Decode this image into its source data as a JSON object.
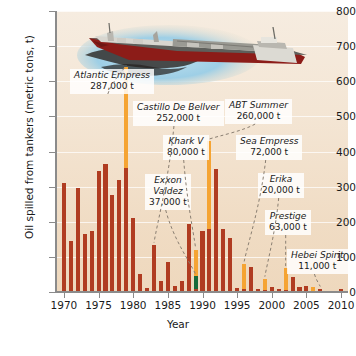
{
  "chart_data": {
    "type": "bar",
    "title": "",
    "xlabel": "Year",
    "ylabel": "Oil spilled from tankers (metric tons, t)",
    "xlim": [
      1969,
      2011
    ],
    "ylim": [
      0,
      800
    ],
    "ytick_labels": [
      "0",
      "100",
      "200",
      "300",
      "400",
      "500",
      "600",
      "700",
      "800"
    ],
    "ytick_values": [
      0,
      100,
      200,
      300,
      400,
      500,
      600,
      700,
      800
    ],
    "xtick_labels": [
      "1970",
      "1975",
      "1980",
      "1985",
      "1990",
      "1995",
      "2000",
      "2005",
      "2010"
    ],
    "xtick_values": [
      1970,
      1975,
      1980,
      1985,
      1990,
      1995,
      2000,
      2005,
      2010
    ],
    "grid": "horizontal",
    "legend": "none",
    "series": [
      {
        "name": "Oil spilled from tankers",
        "color": "#b03c21"
      },
      {
        "name": "Major named spill",
        "color": "#f5a433"
      },
      {
        "name": "Exxon Valdez",
        "color": "#176a3a"
      }
    ],
    "x": [
      1970,
      1971,
      1972,
      1973,
      1974,
      1975,
      1976,
      1977,
      1978,
      1979,
      1980,
      1981,
      1982,
      1983,
      1984,
      1985,
      1986,
      1987,
      1988,
      1989,
      1990,
      1991,
      1992,
      1993,
      1994,
      1995,
      1996,
      1997,
      1998,
      1999,
      2000,
      2001,
      2002,
      2003,
      2004,
      2005,
      2006,
      2007,
      2008,
      2009,
      2010
    ],
    "values": [
      310,
      145,
      295,
      165,
      175,
      345,
      365,
      275,
      320,
      640,
      210,
      50,
      12,
      135,
      30,
      85,
      18,
      30,
      195,
      120,
      175,
      430,
      350,
      180,
      155,
      12,
      80,
      72,
      10,
      38,
      14,
      8,
      67,
      42,
      15,
      18,
      13,
      10,
      4,
      2,
      10
    ],
    "base_values": [
      310,
      145,
      295,
      165,
      175,
      345,
      365,
      275,
      320,
      353,
      210,
      50,
      12,
      135,
      30,
      85,
      18,
      30,
      195,
      8,
      175,
      180,
      350,
      180,
      155,
      12,
      10,
      72,
      10,
      5,
      14,
      8,
      5,
      42,
      15,
      18,
      3,
      10,
      4,
      2,
      10
    ],
    "highlight_values": [
      0,
      0,
      0,
      0,
      0,
      0,
      0,
      0,
      0,
      287,
      0,
      0,
      0,
      0,
      0,
      0,
      0,
      0,
      0,
      75,
      0,
      250,
      0,
      0,
      0,
      0,
      70,
      0,
      0,
      33,
      0,
      0,
      62,
      0,
      0,
      0,
      10,
      0,
      0,
      0,
      0
    ],
    "green_values": [
      0,
      0,
      0,
      0,
      0,
      0,
      0,
      0,
      0,
      0,
      0,
      0,
      0,
      0,
      0,
      0,
      0,
      0,
      0,
      37,
      0,
      0,
      0,
      0,
      0,
      0,
      0,
      0,
      0,
      0,
      0,
      0,
      0,
      0,
      0,
      0,
      0,
      0,
      0,
      0,
      0
    ],
    "annotations": [
      {
        "name": "Atlantic Empress",
        "amount": "287,000 t",
        "year": 1979,
        "value": 287
      },
      {
        "name": "Castillo De Bellver",
        "amount": "252,000 t",
        "year": 1983,
        "value": 252
      },
      {
        "name": "Khark V",
        "amount": "80,000 t",
        "year": 1989,
        "value": 80
      },
      {
        "name": "Exxon Valdez",
        "amount": "37,000 t",
        "year": 1989,
        "value": 37
      },
      {
        "name": "ABT Summer",
        "amount": "260,000 t",
        "year": 1991,
        "value": 260
      },
      {
        "name": "Sea Empress",
        "amount": "72,000 t",
        "year": 1996,
        "value": 72
      },
      {
        "name": "Erika",
        "amount": "20,000 t",
        "year": 1999,
        "value": 20
      },
      {
        "name": "Prestige",
        "amount": "63,000 t",
        "year": 2002,
        "value": 63
      },
      {
        "name": "Hebei Spirit",
        "amount": "11,000 t",
        "year": 2007,
        "value": 11
      }
    ],
    "illustration": "oil-tanker-ship-with-spill"
  },
  "axis": {
    "y_title": "Oil spilled from tankers (metric tons, t)",
    "x_title": "Year"
  },
  "colors": {
    "bar": "#b03c21",
    "highlight": "#f5a433",
    "exxon": "#176a3a",
    "panel": "#f2e2cd",
    "axis": "#8b8b8b",
    "text": "#1a1a1a"
  }
}
